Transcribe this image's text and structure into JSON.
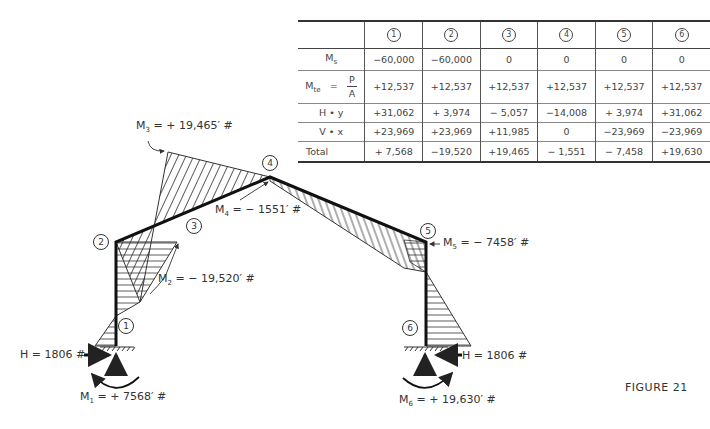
{
  "figure": {
    "caption": "FIGURE 21"
  },
  "table": {
    "header": [
      "",
      "1",
      "2",
      "3",
      "4",
      "5",
      "6"
    ],
    "rows": [
      {
        "label": "Ms",
        "label_main": "M",
        "label_sub": "s",
        "values": [
          "−60,000",
          "−60,000",
          "0",
          "0",
          "0",
          "0"
        ]
      },
      {
        "label": "Mte = P/A",
        "label_main": "M",
        "label_sub": "te",
        "eq": "=",
        "frac_num": "P",
        "frac_den": "A",
        "values": [
          "+12,537",
          "+12,537",
          "+12,537",
          "+12,537",
          "+12,537",
          "+12,537"
        ]
      },
      {
        "label": "H • y",
        "values": [
          "+31,062",
          "+ 3,974",
          "− 5,057",
          "−14,008",
          "+ 3,974",
          "+31,062"
        ]
      },
      {
        "label": "V • x",
        "values": [
          "+23,969",
          "+23,969",
          "+11,985",
          "0",
          "−23,969",
          "−23,969"
        ]
      },
      {
        "label": "Total",
        "values": [
          "+ 7,568",
          "−19,520",
          "+19,465",
          "− 1,551",
          "− 7,458",
          "+19,630"
        ]
      }
    ]
  },
  "nodes": [
    {
      "id": "1",
      "x": 124,
      "y": 324
    },
    {
      "id": "2",
      "x": 93,
      "y": 233
    },
    {
      "id": "3",
      "x": 186,
      "y": 218
    },
    {
      "id": "4",
      "x": 262,
      "y": 154
    },
    {
      "id": "5",
      "x": 420,
      "y": 224
    },
    {
      "id": "6",
      "x": 400,
      "y": 324
    }
  ],
  "annotations": {
    "m1": {
      "main": "M",
      "sub": "1",
      "text": " = + 7568′ #"
    },
    "m2": {
      "main": "M",
      "sub": "2",
      "text": " = − 19,520′ #"
    },
    "m3": {
      "main": "M",
      "sub": "3",
      "text": " = + 19,465′ #"
    },
    "m4": {
      "main": "M",
      "sub": "4",
      "text": " = − 1551′ #"
    },
    "m5": {
      "main": "M",
      "sub": "5",
      "text": " = − 7458′ #"
    },
    "m6": {
      "main": "M",
      "sub": "6",
      "text": " = + 19,630′ #"
    },
    "h_left": "H = 1806 #",
    "h_right": "H = 1806 #"
  },
  "colors": {
    "ink": "#333333",
    "background": "#ffffff"
  }
}
